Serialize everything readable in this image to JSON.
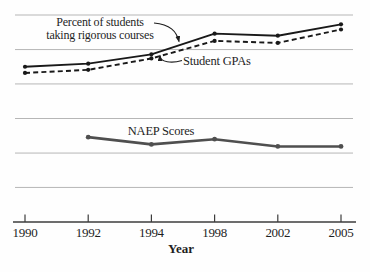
{
  "figure": {
    "background": "#fefefe"
  },
  "annotations": {
    "rigorous_line1": "Percent of students",
    "rigorous_line2": "taking rigorous courses",
    "gpa_label": "Student GPAs",
    "naep_label": "NAEP Scores"
  },
  "chart_data": {
    "type": "line",
    "categories": [
      "1990",
      "1992",
      "1994",
      "1998",
      "2002",
      "2005"
    ],
    "series": [
      {
        "name": "Percent of students taking rigorous courses",
        "style": "solid-black",
        "values": [
          75,
          76.5,
          81,
          91,
          90,
          95.5
        ]
      },
      {
        "name": "Student GPAs",
        "style": "dashed-black",
        "values": [
          72,
          73.5,
          79,
          87.5,
          86.5,
          93
        ]
      },
      {
        "name": "NAEP Scores",
        "style": "solid-gray",
        "values": [
          null,
          41,
          37.5,
          40,
          36.5,
          36.5
        ]
      }
    ],
    "title": "",
    "xlabel": "Year",
    "ylabel": "",
    "ylim": [
      0,
      100
    ],
    "grid": "horizontal-gridlines",
    "gridline_values": [
      16.7,
      33.3,
      50,
      66.7,
      83.3,
      100
    ],
    "legend": "inline-annotations",
    "note": "No y-axis scale shown in source figure; values are relative positions (0 = x-axis, 100 = top gridline)."
  },
  "colors": {
    "line_black": "#191919",
    "line_gray": "#4f4f4f",
    "gridline": "#b6b6b6",
    "axis": "#3c3c3c",
    "text": "#1e1e1e"
  }
}
